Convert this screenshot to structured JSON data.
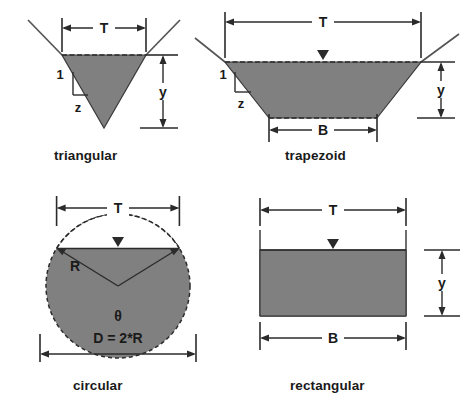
{
  "figure": {
    "fill_color": "#808080",
    "line_color": "#2b2b2b"
  },
  "panels": {
    "triangular": {
      "caption": "triangular",
      "labels": {
        "top_width": "T",
        "depth": "y",
        "slope_vertical": "1",
        "slope_horizontal": "z"
      }
    },
    "trapezoid": {
      "caption": "trapezoid",
      "labels": {
        "top_width": "T",
        "bottom_width": "B",
        "depth": "y",
        "slope_vertical": "1",
        "slope_horizontal": "z"
      }
    },
    "circular": {
      "caption": "circular",
      "labels": {
        "top_width": "T",
        "radius": "R",
        "angle": "θ",
        "diameter": "D = 2*R"
      }
    },
    "rectangular": {
      "caption": "rectangular",
      "labels": {
        "top_width": "T",
        "bottom_width": "B",
        "depth": "y"
      }
    }
  }
}
